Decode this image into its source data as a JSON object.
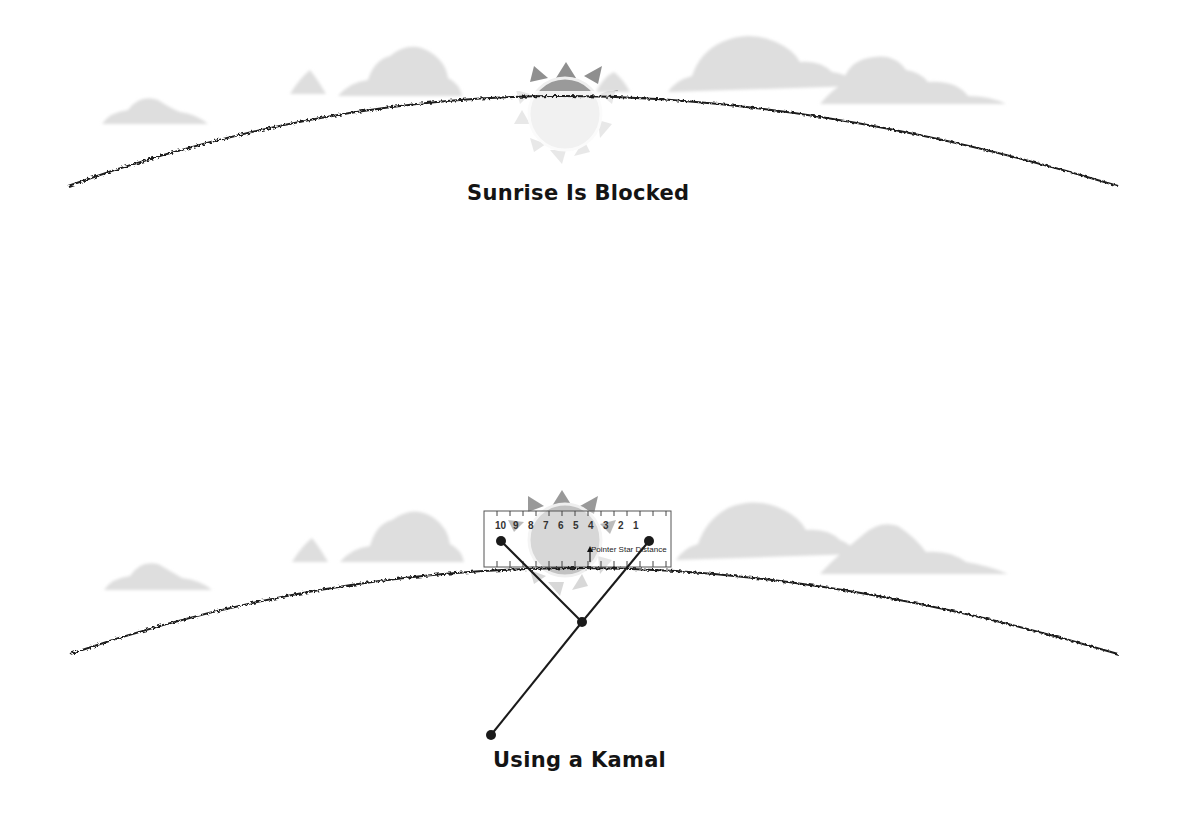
{
  "diagram": {
    "panels": [
      {
        "id": "top",
        "caption": "Sunrise Is Blocked",
        "elements": [
          "horizon-curve",
          "clouds",
          "sun-partially-risen"
        ]
      },
      {
        "id": "bottom",
        "caption": "Using a Kamal",
        "elements": [
          "horizon-curve",
          "clouds",
          "sun",
          "kamal-ruler",
          "kamal-string"
        ]
      }
    ],
    "ruler": {
      "ticks": [
        "10",
        "9",
        "8",
        "7",
        "6",
        "5",
        "4",
        "3",
        "2",
        "1"
      ],
      "annotation": "Pointer Star Distance"
    },
    "colors": {
      "horizon": "#1a1a1a",
      "cloud": "#dcdcdc",
      "sun_body": "#c8c8c8",
      "sun_ray": "#8a8a8a",
      "ruler_border": "#555555"
    }
  }
}
